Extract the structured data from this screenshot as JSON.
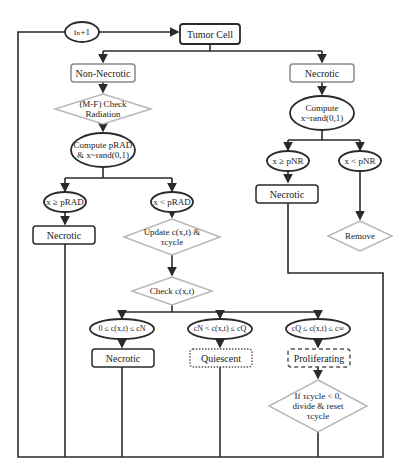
{
  "nodes": {
    "time_step": "tₙ+1",
    "tumor_cell": "Tumor Cell",
    "non_necrotic": "Non-Necrotic",
    "necrotic_branch": "Necrotic",
    "check_radiation": "(M-F) Check Radiation",
    "compute_prad": "Compute pRAD & x~rand(0,1)",
    "compute_right": "Compute x~rand(0,1)",
    "x_ge_prad": "x ≥ pRAD",
    "x_lt_prad": "x < pRAD",
    "x_ge_pnr": "x ≥ pNR",
    "x_lt_pnr": "x < pNR",
    "necrotic_left": "Necrotic",
    "necrotic_right": "Necrotic",
    "remove": "Remove",
    "update": "Update c(x,t) & τcycle",
    "check_c": "Check c(x,t)",
    "cond_necrotic": "0 ≤ c(x,t) ≤ cN",
    "cond_quiescent": "cN < c(x,t) ≤ cQ",
    "cond_proliferating": "cQ ≤ c(x,t) ≤ c∞",
    "necrotic_bottom": "Necrotic",
    "quiescent": "Quiescent",
    "proliferating": "Proliferating",
    "divide": "If τcycle < 0, divide & reset τcycle"
  },
  "colors": {
    "line": "#2a2a2a",
    "gray_border": "#8a8a8a",
    "diamond_border": "#b8b8b8",
    "text": "#222222"
  }
}
